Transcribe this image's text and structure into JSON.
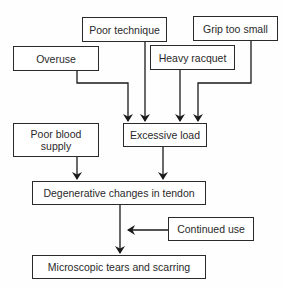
{
  "diagram": {
    "type": "flowchart",
    "nodes": {
      "overuse": "Overuse",
      "poor_technique": "Poor technique",
      "grip_too_small": "Grip too small",
      "heavy_racquet": "Heavy racquet",
      "poor_blood_supply": "Poor blood supply",
      "excessive_load": "Excessive load",
      "degenerative_changes": "Degenerative changes in tendon",
      "continued_use": "Continued use",
      "microscopic_tears": "Microscopic tears and scarring"
    },
    "edges": [
      {
        "from": "Overuse",
        "to": "Excessive load"
      },
      {
        "from": "Poor technique",
        "to": "Excessive load"
      },
      {
        "from": "Heavy racquet",
        "to": "Excessive load"
      },
      {
        "from": "Grip too small",
        "to": "Excessive load"
      },
      {
        "from": "Poor blood supply",
        "to": "Degenerative changes in tendon"
      },
      {
        "from": "Excessive load",
        "to": "Degenerative changes in tendon"
      },
      {
        "from": "Degenerative changes in tendon",
        "to": "Microscopic tears and scarring"
      },
      {
        "from": "Continued use",
        "to": "Microscopic tears and scarring"
      }
    ],
    "colors": {
      "stroke": "#2a2a2a",
      "background": "#ffffff"
    }
  }
}
